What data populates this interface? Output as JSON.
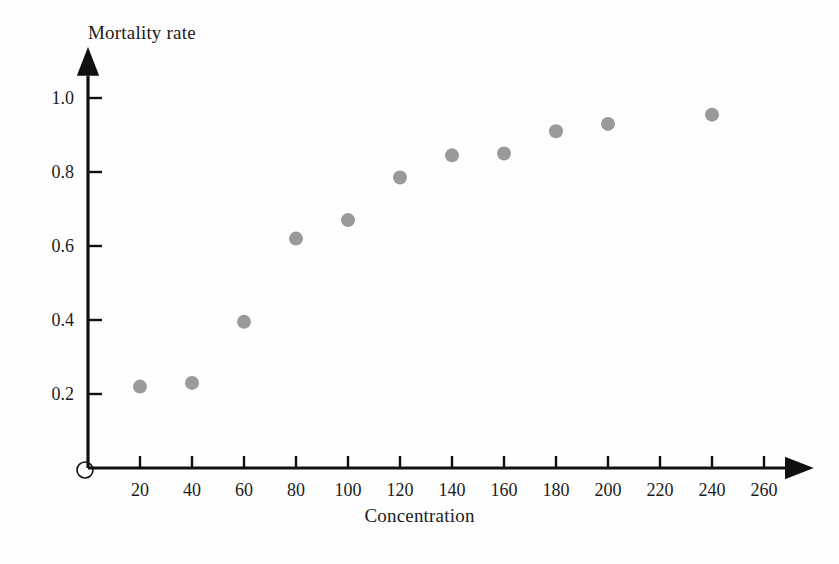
{
  "chart_data": {
    "type": "scatter",
    "title": "",
    "xlabel": "Concentration",
    "ylabel": "Mortality rate",
    "xlim": [
      0,
      270
    ],
    "ylim": [
      0,
      1.06
    ],
    "grid": false,
    "legend": null,
    "x_ticks": [
      20,
      40,
      60,
      80,
      100,
      120,
      140,
      160,
      180,
      200,
      220,
      240,
      260
    ],
    "x_tick_labels": [
      "20",
      "40",
      "60",
      "80",
      "100",
      "120",
      "140",
      "160",
      "180",
      "200",
      "220",
      "240",
      "260"
    ],
    "y_ticks": [
      0.2,
      0.4,
      0.6,
      0.8,
      1.0
    ],
    "y_tick_labels": [
      "0.2",
      "0.4",
      "0.6",
      "0.8",
      "1.0"
    ],
    "origin_label": "O",
    "marker": {
      "shape": "circle",
      "color": "#9a9a9a",
      "radius_px": 7
    },
    "axis_color": "#111111",
    "series": [
      {
        "name": "Mortality rate vs Concentration",
        "points": [
          {
            "x": 20,
            "y": 0.22
          },
          {
            "x": 40,
            "y": 0.23
          },
          {
            "x": 60,
            "y": 0.395
          },
          {
            "x": 80,
            "y": 0.62
          },
          {
            "x": 100,
            "y": 0.67
          },
          {
            "x": 120,
            "y": 0.785
          },
          {
            "x": 140,
            "y": 0.845
          },
          {
            "x": 160,
            "y": 0.85
          },
          {
            "x": 180,
            "y": 0.91
          },
          {
            "x": 200,
            "y": 0.93
          },
          {
            "x": 240,
            "y": 0.955
          }
        ]
      }
    ]
  }
}
